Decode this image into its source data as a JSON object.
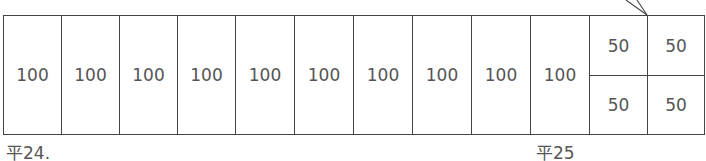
{
  "diagram": {
    "full_cells": [
      "100",
      "100",
      "100",
      "100",
      "100",
      "100",
      "100",
      "100",
      "100",
      "100"
    ],
    "split_cells": [
      {
        "top": "50",
        "bottom": "50"
      },
      {
        "top": "50",
        "bottom": "50"
      }
    ],
    "labels": {
      "start": "平24.",
      "end": "平25"
    }
  }
}
